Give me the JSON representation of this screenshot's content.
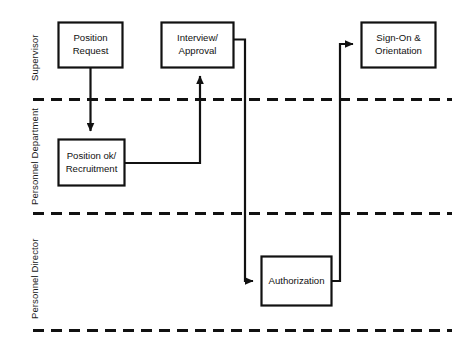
{
  "diagram": {
    "type": "swimlane-flowchart",
    "colors": {
      "stroke": "#111111",
      "background": "#ffffff",
      "text": "#111111"
    },
    "lanes": [
      {
        "id": "supervisor",
        "label": "Supervisor"
      },
      {
        "id": "personnel-department",
        "label": "Personnel Department"
      },
      {
        "id": "personnel-director",
        "label": "Personnel Director"
      }
    ],
    "nodes": [
      {
        "id": "position-request",
        "lane": "supervisor",
        "lines": [
          "Position",
          "Request"
        ],
        "line1": "Position",
        "line2": "Request"
      },
      {
        "id": "interview-approval",
        "lane": "supervisor",
        "lines": [
          "Interview/",
          "Approval"
        ],
        "line1": "Interview/",
        "line2": "Approval"
      },
      {
        "id": "sign-on-orientation",
        "lane": "supervisor",
        "lines": [
          "Sign-On &",
          "Orientation"
        ],
        "line1": "Sign-On &",
        "line2": "Orientation"
      },
      {
        "id": "position-ok-recruitment",
        "lane": "personnel-department",
        "lines": [
          "Position ok/",
          "Recruitment"
        ],
        "line1": "Position ok/",
        "line2": "Recruitment"
      },
      {
        "id": "authorization",
        "lane": "personnel-director",
        "lines": [
          "Authorization"
        ],
        "line1": "Authorization",
        "line2": ""
      }
    ],
    "edges": [
      {
        "id": "edge-request-to-recruitment",
        "from": "position-request",
        "to": "position-ok-recruitment",
        "arrow": true
      },
      {
        "id": "edge-recruitment-to-interview",
        "from": "position-ok-recruitment",
        "to": "interview-approval",
        "arrow": true
      },
      {
        "id": "edge-interview-to-authorization",
        "from": "interview-approval",
        "to": "authorization",
        "arrow": true
      },
      {
        "id": "edge-authorization-to-signon",
        "from": "authorization",
        "to": "sign-on-orientation",
        "arrow": true
      }
    ]
  }
}
